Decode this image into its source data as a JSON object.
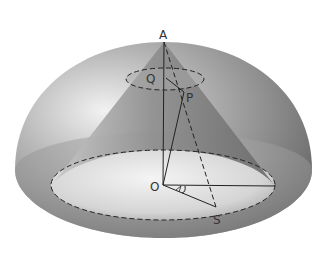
{
  "diagram": {
    "type": "geometry-3d",
    "labels": {
      "apex": "A",
      "small_circle_center": "Q",
      "point_on_cone": "P",
      "base_center": "O",
      "point_on_base": "S"
    },
    "colors": {
      "background": "#ffffff",
      "hemisphere_dark": "#6e6e6e",
      "hemisphere_light": "#e6e6e6",
      "cone": "#8a8a8a",
      "lines": "#2a2a2a"
    }
  }
}
